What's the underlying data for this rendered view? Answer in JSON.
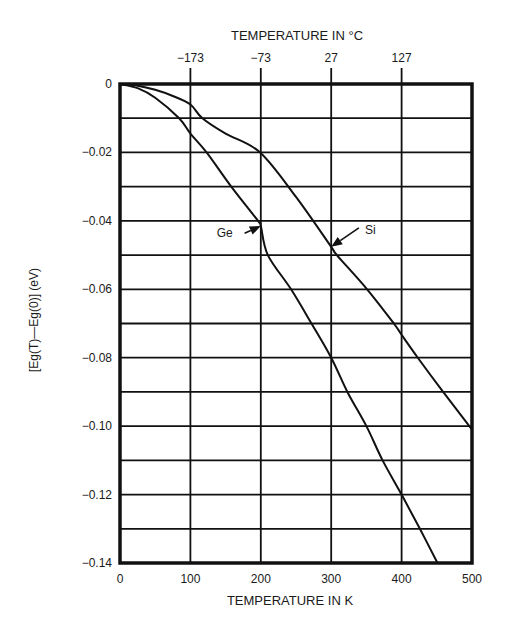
{
  "chart_data": {
    "type": "line",
    "title": "",
    "xlabel": "TEMPERATURE IN K",
    "ylabel": "[Eg(T)—Eg(0)] (eV)",
    "top_xlabel": "TEMPERATURE IN °C",
    "xlim": [
      0,
      500
    ],
    "ylim": [
      -0.14,
      0
    ],
    "grid": true,
    "x_ticks": [
      0,
      100,
      200,
      300,
      400,
      500
    ],
    "x_tick_labels": [
      "0",
      "100",
      "200",
      "300",
      "400",
      "500"
    ],
    "top_x_ticks": [
      100,
      200,
      300,
      400
    ],
    "top_x_tick_labels": [
      "−173",
      "−73",
      "27",
      "127"
    ],
    "y_ticks": [
      0,
      -0.01,
      -0.02,
      -0.03,
      -0.04,
      -0.05,
      -0.06,
      -0.07,
      -0.08,
      -0.09,
      -0.1,
      -0.11,
      -0.12,
      -0.13,
      -0.14
    ],
    "y_tick_labels": [
      "0",
      "",
      "−0.02",
      "",
      "−0.04",
      "",
      "−0.06",
      "",
      "−0.08",
      "",
      "−0.10",
      "",
      "−0.12",
      "",
      "−0.14"
    ],
    "series": [
      {
        "name": "Ge",
        "x": [
          0,
          25,
          50,
          84,
          100,
          123,
          158,
          196,
          200,
          210,
          243,
          272,
          300,
          323,
          350,
          373,
          400,
          426,
          451
        ],
        "y": [
          0,
          -0.0012,
          -0.004,
          -0.01,
          -0.0145,
          -0.02,
          -0.03,
          -0.04,
          -0.0415,
          -0.05,
          -0.06,
          -0.07,
          -0.08,
          -0.09,
          -0.1,
          -0.11,
          -0.12,
          -0.13,
          -0.14
        ]
      },
      {
        "name": "Si",
        "x": [
          0,
          25,
          50,
          75,
          100,
          117,
          150,
          199,
          250,
          300,
          308,
          351,
          389,
          400,
          423,
          459,
          500
        ],
        "y": [
          0,
          -0.0005,
          -0.0017,
          -0.0035,
          -0.006,
          -0.01,
          -0.0145,
          -0.02,
          -0.033,
          -0.0476,
          -0.05,
          -0.06,
          -0.07,
          -0.0733,
          -0.08,
          -0.09,
          -0.101
        ]
      }
    ],
    "annotations": [
      {
        "text": "Ge",
        "arrow_to": [
          200,
          -0.0415
        ],
        "label_at": [
          160,
          -0.0445
        ]
      },
      {
        "text": "Si",
        "arrow_to": [
          300,
          -0.0476
        ],
        "label_at": [
          345,
          -0.0435
        ]
      }
    ]
  }
}
